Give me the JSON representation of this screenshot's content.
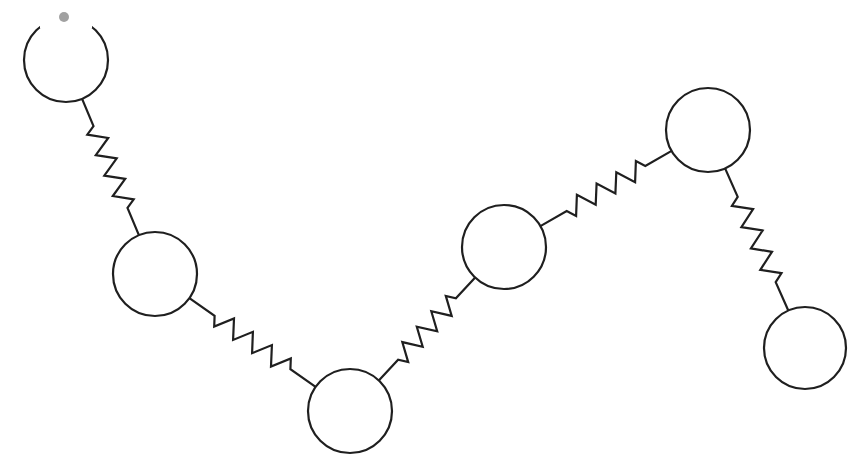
{
  "diagram": {
    "type": "bead-spring-chain",
    "background": "#ffffff",
    "stroke_color": "#1f1f1f",
    "beads": [
      {
        "id": "bead-1",
        "cx": 66,
        "cy": 60,
        "r": 42
      },
      {
        "id": "bead-2",
        "cx": 155,
        "cy": 274,
        "r": 42
      },
      {
        "id": "bead-3",
        "cx": 350,
        "cy": 411,
        "r": 42
      },
      {
        "id": "bead-4",
        "cx": 504,
        "cy": 247,
        "r": 42
      },
      {
        "id": "bead-5",
        "cx": 708,
        "cy": 130,
        "r": 42
      },
      {
        "id": "bead-6",
        "cx": 805,
        "cy": 348,
        "r": 41
      }
    ],
    "springs": [
      {
        "id": "spring-1-2",
        "from": "bead-1",
        "to": "bead-2",
        "coils": 4
      },
      {
        "id": "spring-2-3",
        "from": "bead-2",
        "to": "bead-3",
        "coils": 4
      },
      {
        "id": "spring-3-4",
        "from": "bead-3",
        "to": "bead-4",
        "coils": 4
      },
      {
        "id": "spring-4-5",
        "from": "bead-4",
        "to": "bead-5",
        "coils": 4
      },
      {
        "id": "spring-5-6",
        "from": "bead-5",
        "to": "bead-6",
        "coils": 4
      }
    ],
    "artifacts": [
      {
        "id": "smudge-top",
        "cx": 64,
        "cy": 17,
        "r": 5
      }
    ]
  }
}
